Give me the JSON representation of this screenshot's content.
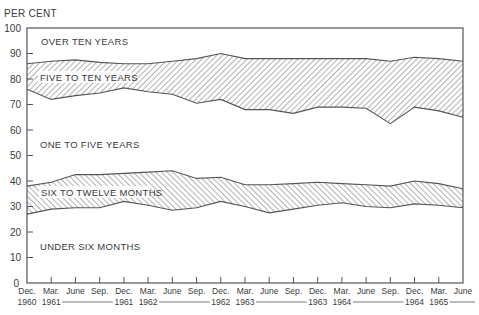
{
  "chart_data": {
    "type": "area",
    "title": "",
    "ylabel": "PER CENT",
    "xlabel": "",
    "ylim": [
      0,
      100
    ],
    "yticks": [
      0,
      10,
      20,
      30,
      40,
      50,
      60,
      70,
      80,
      90,
      100
    ],
    "grid": false,
    "x": [
      "Dec. 1960",
      "Mar. 1961",
      "June 1961",
      "Sep. 1961",
      "Dec. 1961",
      "Mar. 1962",
      "June 1962",
      "Sep. 1962",
      "Dec. 1962",
      "Mar. 1963",
      "June 1963",
      "Sep. 1963",
      "Dec. 1963",
      "Mar. 1964",
      "June 1964",
      "Sep. 1964",
      "Dec. 1964",
      "Mar. 1965",
      "June 1965"
    ],
    "x_tick_labels": [
      "Dec.",
      "Mar.",
      "June",
      "Sep.",
      "Dec.",
      "Mar.",
      "June",
      "Sep.",
      "Dec.",
      "Mar.",
      "June",
      "Sep.",
      "Dec.",
      "Mar.",
      "June",
      "Sep.",
      "Dec.",
      "Mar.",
      "June"
    ],
    "year_labels": [
      {
        "text": "1960",
        "index": 0
      },
      {
        "text": "1961",
        "index": 1
      },
      {
        "text": "1961",
        "index": 4
      },
      {
        "text": "1962",
        "index": 5
      },
      {
        "text": "1962",
        "index": 8
      },
      {
        "text": "1963",
        "index": 9
      },
      {
        "text": "1963",
        "index": 12
      },
      {
        "text": "1964",
        "index": 13
      },
      {
        "text": "1964",
        "index": 16
      },
      {
        "text": "1965",
        "index": 17
      }
    ],
    "boundaries_cumulative_percent": {
      "under_six_months_top": [
        27,
        29,
        29.5,
        29.5,
        32,
        30.5,
        28.5,
        29.5,
        32,
        30,
        27.5,
        29,
        30.5,
        31.5,
        30,
        29.5,
        31,
        30.5,
        29.5
      ],
      "six_to_twelve_months_top": [
        38,
        39.5,
        42.5,
        42.5,
        43,
        43.5,
        44,
        41,
        41.5,
        38.5,
        38.5,
        39,
        39.5,
        39,
        38.5,
        38,
        40,
        39,
        37
      ],
      "one_to_five_years_top": [
        76,
        72,
        73.5,
        74.5,
        76.5,
        75,
        74,
        70.5,
        72,
        68,
        68,
        66.5,
        69,
        69,
        68.5,
        62.5,
        69,
        67.5,
        65
      ],
      "five_to_ten_years_top": [
        86,
        87,
        87.5,
        86.5,
        86,
        86,
        87,
        88,
        90,
        88,
        88,
        88,
        88,
        88,
        88,
        87,
        88.5,
        88,
        87
      ]
    },
    "series": [
      {
        "name": "UNDER SIX MONTHS",
        "values": [
          27,
          29,
          29.5,
          29.5,
          32,
          30.5,
          28.5,
          29.5,
          32,
          30,
          27.5,
          29,
          30.5,
          31.5,
          30,
          29.5,
          31,
          30.5,
          29.5
        ],
        "hatched": false
      },
      {
        "name": "SIX TO TWELVE MONTHS",
        "values": [
          11,
          10.5,
          13,
          13,
          11,
          13,
          15.5,
          11.5,
          9.5,
          8.5,
          11,
          10,
          9,
          7.5,
          8.5,
          8.5,
          9,
          8.5,
          7.5
        ],
        "hatched": true
      },
      {
        "name": "ONE TO FIVE YEARS",
        "values": [
          38,
          32.5,
          31,
          32,
          33.5,
          31.5,
          30,
          29.5,
          30.5,
          29.5,
          29.5,
          27.5,
          29.5,
          30,
          30,
          24.5,
          29,
          28.5,
          28
        ],
        "hatched": false
      },
      {
        "name": "FIVE TO TEN YEARS",
        "values": [
          10,
          15,
          14,
          12,
          9.5,
          11,
          13,
          17.5,
          18,
          20,
          20,
          21.5,
          19,
          19,
          19.5,
          24.5,
          19.5,
          20.5,
          22
        ],
        "hatched": true
      },
      {
        "name": "OVER TEN YEARS",
        "values": [
          14,
          13,
          12.5,
          13.5,
          14,
          14,
          13,
          12,
          10,
          12,
          12,
          12,
          12,
          12,
          12,
          13,
          11.5,
          12,
          13
        ],
        "hatched": false
      }
    ],
    "legend": "inline band labels",
    "colors": {
      "ink": "#3a3a3a",
      "hatch": "#555555",
      "background": "#ffffff"
    }
  },
  "labels": {
    "y_unit": "PER CENT",
    "over_ten_years": "OVER TEN YEARS",
    "five_to_ten_years": "FIVE TO TEN YEARS",
    "one_to_five_years": "ONE TO FIVE YEARS",
    "six_to_twelve_months": "SIX TO TWELVE MONTHS",
    "under_six_months": "UNDER SIX MONTHS"
  }
}
